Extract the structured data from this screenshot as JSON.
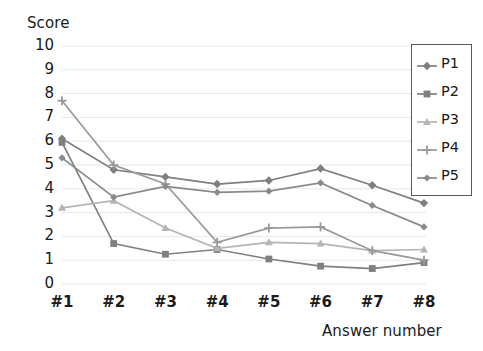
{
  "chart_data": {
    "type": "line",
    "title": "",
    "subtitle": "",
    "xlabel": "Answer number",
    "ylabel": "Score",
    "categories": [
      "#1",
      "#2",
      "#3",
      "#4",
      "#5",
      "#6",
      "#7",
      "#8"
    ],
    "ylim": [
      0,
      10
    ],
    "ytick_labels": [
      "10",
      "9",
      "8",
      "7",
      "6",
      "5",
      "4",
      "3",
      "2",
      "1",
      "0"
    ],
    "ytick_values": [
      10,
      9,
      8,
      7,
      6,
      5,
      4,
      3,
      2,
      1,
      0
    ],
    "grid": true,
    "grid_axis": "y",
    "legend_position": "right",
    "series": [
      {
        "name": "P1",
        "marker": "diamond",
        "color": "#7f7f7f",
        "values": [
          6.1,
          4.8,
          4.5,
          4.2,
          4.35,
          4.85,
          4.15,
          3.4
        ]
      },
      {
        "name": "P2",
        "marker": "square",
        "color": "#808080",
        "values": [
          5.95,
          1.7,
          1.25,
          1.45,
          1.05,
          0.75,
          0.65,
          0.9
        ]
      },
      {
        "name": "P3",
        "marker": "triangle",
        "color": "#b5b5b5",
        "values": [
          3.2,
          3.5,
          2.35,
          1.5,
          1.75,
          1.7,
          1.4,
          1.45
        ]
      },
      {
        "name": "P4",
        "marker": "cross",
        "color": "#9a9a9a",
        "values": [
          7.7,
          5.0,
          4.2,
          1.75,
          2.35,
          2.4,
          1.4,
          1.0
        ]
      },
      {
        "name": "P5",
        "marker": "diamond-small",
        "color": "#8a8a8a",
        "values": [
          5.3,
          3.65,
          4.1,
          3.85,
          3.9,
          4.25,
          3.3,
          2.4
        ]
      }
    ]
  },
  "legend": {
    "entries": [
      {
        "label": "P1"
      },
      {
        "label": "P2"
      },
      {
        "label": "P3"
      },
      {
        "label": "P4"
      },
      {
        "label": "P5"
      }
    ]
  },
  "colors": {
    "grid": "#e8e8e8",
    "axis": "#d9d9d9",
    "text": "#1a1a1a",
    "legend_border": "#5a5a5a"
  }
}
